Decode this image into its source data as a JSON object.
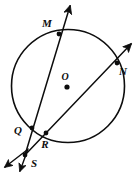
{
  "figure": {
    "type": "geometry-diagram",
    "width": 139,
    "height": 176,
    "background_color": "#ffffff",
    "ink_color": "#0d0d0d"
  },
  "circle": {
    "name": "circle-O",
    "center_label": "O",
    "center_x": 68,
    "center_y": 86,
    "radius": 56.5,
    "stroke_width": 1.6
  },
  "labels": {
    "center": "O",
    "top": "M",
    "right": "N",
    "lower_left": "Q",
    "bottom_left": "R",
    "external": "S"
  },
  "points": [
    {
      "name": "point-M",
      "label": "M",
      "x": 59,
      "y": 34,
      "label_x": 47,
      "label_y": 27,
      "on_circle": true,
      "dot": true
    },
    {
      "name": "point-N",
      "label": "N",
      "x": 117,
      "y": 63,
      "label_x": 121,
      "label_y": 73,
      "on_circle": true,
      "dot": true
    },
    {
      "name": "point-Q",
      "label": "Q",
      "x": 32,
      "y": 128,
      "label_x": 17,
      "label_y": 134,
      "on_circle": true,
      "dot": true
    },
    {
      "name": "point-R",
      "label": "R",
      "x": 46,
      "y": 133,
      "label_x": 42,
      "label_y": 147,
      "on_circle": true,
      "dot": true
    },
    {
      "name": "point-S",
      "label": "S",
      "x": 25,
      "y": 155,
      "label_x": 31,
      "label_y": 166,
      "on_circle": false,
      "dot": true
    },
    {
      "name": "point-O",
      "label": "O",
      "x": 67,
      "y": 87,
      "label_x": 62,
      "label_y": 80,
      "on_circle": false,
      "dot": true
    }
  ],
  "rays": [
    {
      "name": "ray-SM",
      "from_label": "S",
      "through_labels": [
        "Q",
        "M"
      ],
      "x1": 25,
      "y1": 155,
      "x2": 70,
      "y2": 6,
      "arrow_at": "end",
      "stroke_width": 1.5
    },
    {
      "name": "ray-SN",
      "from_label": "S",
      "through_labels": [
        "R",
        "N"
      ],
      "x1": 25,
      "y1": 155,
      "x2": 131,
      "y2": 44,
      "arrow_at": "end",
      "stroke_width": 1.5
    },
    {
      "name": "ray-S-down-left-a",
      "from_label": "S",
      "through_labels": [],
      "x1": 25,
      "y1": 155,
      "x2": 4,
      "y2": 168,
      "arrow_at": "end",
      "stroke_width": 1.5
    },
    {
      "name": "ray-S-down-left-b",
      "from_label": "S",
      "through_labels": [],
      "x1": 27,
      "y1": 150,
      "x2": 19,
      "y2": 173,
      "arrow_at": "end",
      "stroke_width": 1.5
    }
  ]
}
